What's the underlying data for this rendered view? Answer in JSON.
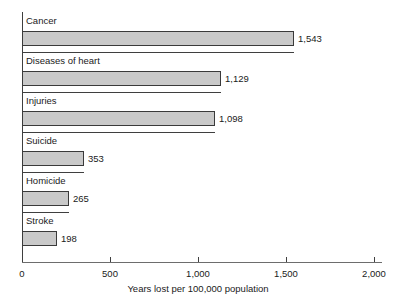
{
  "chart_data": {
    "type": "bar",
    "orientation": "horizontal",
    "title": "",
    "xlabel": "Years lost per 100,000 population",
    "ylabel": "",
    "categories": [
      "Cancer",
      "Diseases of heart",
      "Injuries",
      "Suicide",
      "Homicide",
      "Stroke"
    ],
    "values": [
      1543,
      1129,
      1098,
      353,
      265,
      198
    ],
    "value_labels": [
      "1,543",
      "1,129",
      "1,098",
      "353",
      "265",
      "198"
    ],
    "xlim": [
      0,
      2000
    ],
    "xticks": [
      0,
      500,
      1000,
      1500,
      2000
    ],
    "xtick_labels": [
      "0",
      "500",
      "1,000",
      "1,500",
      "2,000"
    ],
    "grid": false,
    "legend": false,
    "bar_fill_color": "#c9c9c9",
    "bar_border_color": "#3a3a3a",
    "axis_color": "#3f3f3f",
    "text_color": "#1a1a1a"
  }
}
